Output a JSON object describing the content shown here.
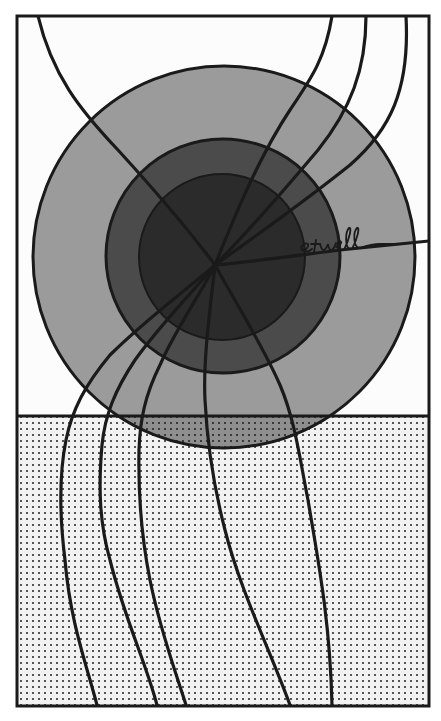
{
  "artwork": {
    "type": "illustration",
    "description": "Stylized sun with three concentric gray rings over a dotted ground plane, with curved rays radiating from the center",
    "signature": "etwell",
    "colors": {
      "paper": "#fcfcfc",
      "outer_ring": "#9b9b9b",
      "middle_ring": "#4b4b4b",
      "inner_disc": "#2b2b2b",
      "ground_dots": "#555555",
      "ink": "#1a1a1a"
    },
    "frame": {
      "x": 17,
      "y": 16,
      "width": 412,
      "height": 690
    },
    "horizon_y": 416,
    "sun": {
      "center": [
        224,
        257
      ],
      "rings": [
        {
          "name": "outer",
          "r": 191
        },
        {
          "name": "middle",
          "r": 118
        },
        {
          "name": "inner",
          "r": 83
        }
      ]
    },
    "ray_count": 10
  }
}
